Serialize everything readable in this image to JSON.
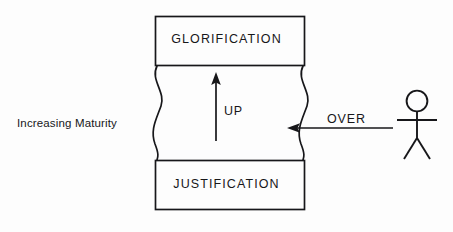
{
  "diagram": {
    "type": "process-flow-diagram",
    "background_color": "#fdfdfd",
    "stroke_color": "#17171a",
    "boxes": [
      {
        "name": "glorification-box",
        "label": "GLORIFICATION",
        "position": "top"
      },
      {
        "name": "justification-box",
        "label": "JUSTIFICATION",
        "position": "bottom"
      }
    ],
    "arrows": [
      {
        "name": "up-arrow",
        "label": "UP",
        "direction": "up",
        "description": "vertical arrow pointing upward from justification toward glorification"
      },
      {
        "name": "over-arrow",
        "label": "OVER",
        "direction": "left",
        "description": "horizontal arrow pointing left from stick figure into the wavy boundary"
      }
    ],
    "axis_label": "Increasing Maturity",
    "figure": {
      "name": "stick-figure",
      "description": "stick figure person standing at right of diagram"
    },
    "wavy_edges": [
      "left-wavy-edge",
      "right-wavy-edge"
    ]
  }
}
